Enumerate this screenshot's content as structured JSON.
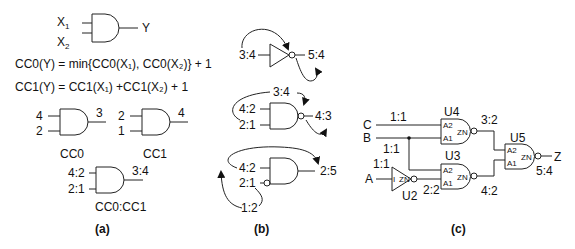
{
  "panel_a": {
    "caption": "(a)",
    "gate": {
      "in1": "X",
      "in1_sub": "1",
      "in2": "X",
      "in2_sub": "2",
      "out": "Y"
    },
    "eq1": "CC0(Y) = min{CC0(X₁), CC0(X₂)} + 1",
    "eq2": "CC1(Y) = CC1(X₁) +CC1(X₂) + 1",
    "cc0": {
      "in1": "4",
      "in2": "2",
      "out": "3",
      "label": "CC0"
    },
    "cc1": {
      "in1": "2",
      "in2": "1",
      "out": "4",
      "label": "CC1"
    },
    "combined": {
      "in1": "4:2",
      "in2": "2:1",
      "out": "3:4",
      "label": "CC0:CC1"
    }
  },
  "panel_b": {
    "caption": "(b)",
    "inverter": {
      "in": "3:4",
      "out": "5:4"
    },
    "nand": {
      "in1": "4:2",
      "in2": "2:1",
      "top": "3:4",
      "out": "4:3"
    },
    "and_inv": {
      "in1": "4:2",
      "in2": "2:1",
      "bottom": "1:2",
      "out": "2:5"
    }
  },
  "panel_c": {
    "caption": "(c)",
    "inputs": {
      "c": "C",
      "b": "B",
      "a": "A"
    },
    "c_label": "1:1",
    "b_label": "1:1",
    "a_label": "1:1",
    "u4": {
      "name": "U4",
      "a2": "A2",
      "a1": "A1",
      "zn": "ZN",
      "out": "3:2"
    },
    "u3": {
      "name": "U3",
      "a2": "A2",
      "a1": "A1",
      "zn": "ZN",
      "out": "4:2"
    },
    "u2": {
      "name": "U2",
      "i": "I",
      "zn": "ZN",
      "out": "2:2"
    },
    "u5": {
      "name": "U5",
      "a2": "A2",
      "a1": "A1",
      "zn": "ZN",
      "out": "5:4"
    },
    "output": "Z"
  }
}
